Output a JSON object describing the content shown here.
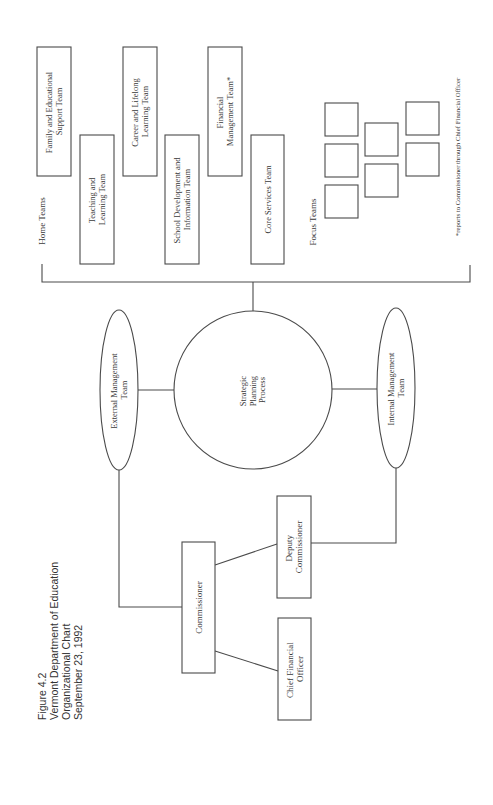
{
  "caption": {
    "figure": "Figure 4.2",
    "org": "Vermont Department of Education",
    "subtitle": "Organizational Chart",
    "date": "September 23, 1992"
  },
  "leadership": {
    "commissioner": "Commissioner",
    "deputy": [
      "Deputy",
      "Commissioner"
    ],
    "cfo": [
      "Chief Financial",
      "Officer"
    ]
  },
  "management": {
    "external": [
      "External Management",
      "Team"
    ],
    "internal": [
      "Internal Management",
      "Team"
    ]
  },
  "strategic": [
    "Strategic",
    "Planning",
    "Process"
  ],
  "home_teams": {
    "label": "Home Teams",
    "teams": [
      {
        "lines": [
          "Family and Educational",
          "Support Team"
        ]
      },
      {
        "lines": [
          "Teaching and",
          "Learning Team"
        ]
      },
      {
        "lines": [
          "Career and Lifelong",
          "Learning Team"
        ]
      },
      {
        "lines": [
          "School Development and",
          "Information Team"
        ]
      },
      {
        "lines": [
          "Financial",
          "Management Team*"
        ]
      },
      {
        "lines": [
          "Core Services Team"
        ]
      }
    ]
  },
  "focus_teams": {
    "label": "Focus Teams",
    "count": 7
  },
  "footnote": "*reports to Commissioner through Chief Financial Officer",
  "colors": {
    "line": "#4a4a4a",
    "text": "#3a3a3a",
    "background": "#ffffff"
  }
}
